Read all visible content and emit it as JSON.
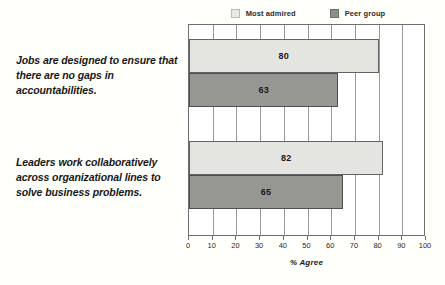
{
  "legend": {
    "entries": [
      {
        "label": "Most admired",
        "swatch": "most-admired-swatch",
        "color": "#e4e4e0"
      },
      {
        "label": "Peer group",
        "swatch": "peer-group-swatch",
        "color": "#969693"
      }
    ]
  },
  "captions": [
    "Jobs are designed to ensure that there are no gaps in accountabilities.",
    "Leaders work collaboratively across organizational lines to solve business problems."
  ],
  "axis": {
    "title": "% Agree",
    "ticks": [
      "0",
      "10",
      "20",
      "30",
      "40",
      "50",
      "60",
      "70",
      "80",
      "90",
      "100"
    ]
  },
  "chart_data": {
    "type": "bar",
    "orientation": "horizontal",
    "title": "",
    "xlabel": "% Agree",
    "ylabel": "",
    "xlim": [
      0,
      100
    ],
    "grid": true,
    "legend_position": "top",
    "categories": [
      "Jobs are designed to ensure that there are no gaps in accountabilities.",
      "Leaders work collaboratively across organizational lines to solve business problems."
    ],
    "series": [
      {
        "name": "Most admired",
        "color": "#e4e4e0",
        "values": [
          80,
          82
        ]
      },
      {
        "name": "Peer group",
        "color": "#969693",
        "values": [
          63,
          65
        ]
      }
    ],
    "bars": [
      {
        "category_index": 0,
        "series": "Most admired",
        "value": 80,
        "label": "80"
      },
      {
        "category_index": 0,
        "series": "Peer group",
        "value": 63,
        "label": "63"
      },
      {
        "category_index": 1,
        "series": "Most admired",
        "value": 82,
        "label": "82"
      },
      {
        "category_index": 1,
        "series": "Peer group",
        "value": 65,
        "label": "65"
      }
    ]
  }
}
